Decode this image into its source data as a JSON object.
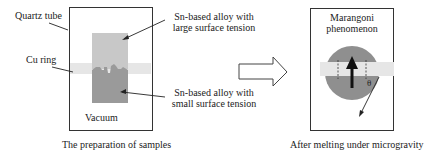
{
  "left_panel": {
    "quartz_tube_label": "Quartz tube",
    "cu_ring_label": "Cu ring",
    "upper_alloy_label_line1": "Sn-based alloy with",
    "upper_alloy_label_line2": "large surface tension",
    "lower_alloy_label_line1": "Sn-based alloy with",
    "lower_alloy_label_line2": "small surface tension",
    "vacuum_label": "Vacuum",
    "caption": "The preparation of samples"
  },
  "right_panel": {
    "title_line1": "Marangoni",
    "title_line2": "phenomenon",
    "angle_symbol": "θ",
    "caption": "After melting under microgravity"
  },
  "colors": {
    "line": "#333333",
    "upper_alloy": "#c8c8c8",
    "lower_alloy": "#9a9a9a",
    "cu_ring": "#e6e6e6",
    "droplet": "#8f8f8f"
  }
}
